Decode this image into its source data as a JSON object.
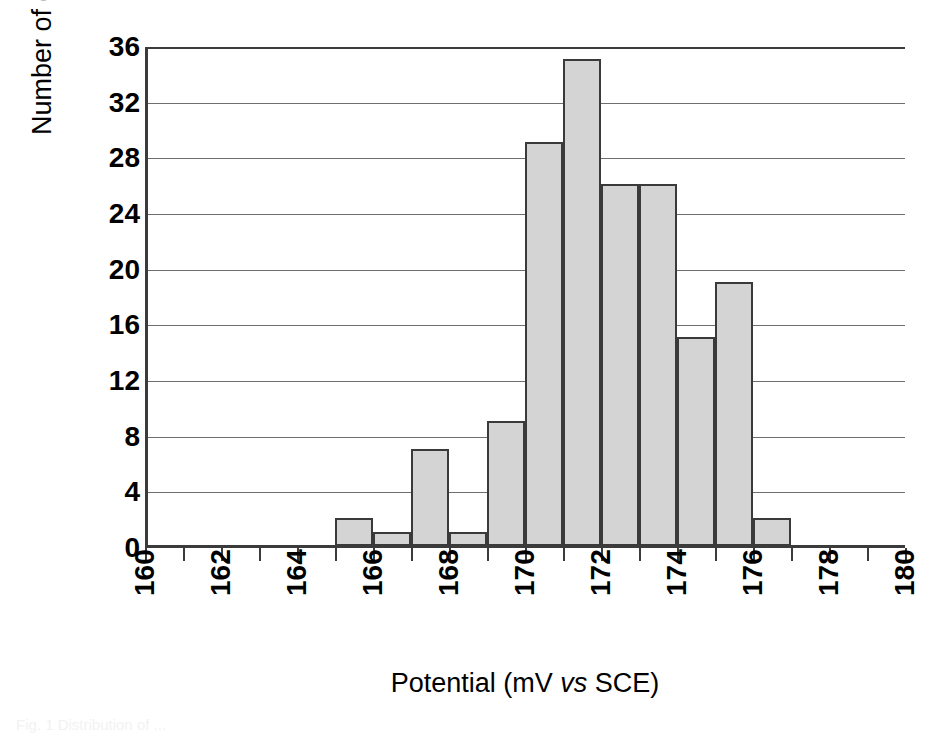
{
  "chart_data": {
    "type": "bar",
    "title": "",
    "subtitle": "",
    "xlabel_parts": {
      "before": "Potential (mV ",
      "italic": "vs",
      "after": " SCE)"
    },
    "xlabel": "Potential (mV vs SCE)",
    "ylabel": "Number of electrodes",
    "xlim": [
      160,
      180
    ],
    "ylim": [
      0,
      36
    ],
    "x_tick_labels": [
      "160",
      "162",
      "164",
      "166",
      "168",
      "170",
      "172",
      "174",
      "176",
      "178",
      "180"
    ],
    "x_tick_values": [
      160,
      162,
      164,
      166,
      168,
      170,
      172,
      174,
      176,
      178,
      180
    ],
    "x_minor_tick_step": 1,
    "y_tick_labels": [
      "0",
      "4",
      "8",
      "12",
      "16",
      "20",
      "24",
      "28",
      "32",
      "36"
    ],
    "y_tick_values": [
      0,
      4,
      8,
      12,
      16,
      20,
      24,
      28,
      32,
      36
    ],
    "grid": "horizontal",
    "legend": "none",
    "bin_width": 1,
    "categories": [
      "165-166",
      "166-167",
      "167-168",
      "168-169",
      "169-170",
      "170-171",
      "171-172",
      "172-173",
      "173-174",
      "174-175",
      "175-176",
      "176-177"
    ],
    "bin_starts": [
      165,
      166,
      167,
      168,
      169,
      170,
      171,
      172,
      173,
      174,
      175,
      176
    ],
    "values": [
      2,
      1,
      7,
      1,
      9,
      29,
      35,
      26,
      26,
      15,
      19,
      2
    ],
    "bar_fill_color": "#d4d4d4",
    "bar_edge_color": "#3a3a3a",
    "gridline_color": "#6e6e6e",
    "axis_color": "#3b3b3b",
    "background_color": "#ffffff"
  },
  "caption": {
    "fragment": "Fig. 1  Distribution of ..."
  }
}
